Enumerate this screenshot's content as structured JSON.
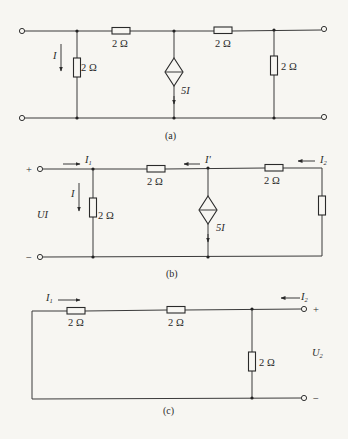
{
  "figure": {
    "colors": {
      "background": "#f7f6f2",
      "ink": "#2a2a2a"
    },
    "panels": [
      {
        "id": "a",
        "caption": "(a)",
        "resistor_labels": [
          "2 Ω",
          "2 Ω",
          "2 Ω",
          "2 Ω"
        ],
        "current_label": "I",
        "source_label": "5I",
        "components": [
          "left shunt resistor 2 Ω with current I downward",
          "series resistor 2 Ω",
          "dependent current source 5I (downward)",
          "series resistor 2 Ω",
          "right shunt resistor 2 Ω"
        ]
      },
      {
        "id": "b",
        "caption": "(b)",
        "resistor_labels": [
          "2 Ω",
          "2 Ω",
          "2 Ω"
        ],
        "current_labels": {
          "i1": "I",
          "i1_sub": "1",
          "i": "I",
          "iprime": "I'",
          "i2": "I",
          "i2_sub": "2"
        },
        "voltage_label": "UI",
        "plus": "+",
        "minus": "−",
        "source_label": "5I"
      },
      {
        "id": "c",
        "caption": "(c)",
        "resistor_labels": [
          "2 Ω",
          "2 Ω",
          "2 Ω"
        ],
        "current_labels": {
          "i1": "I",
          "i1_sub": "1",
          "i2": "I",
          "i2_sub": "2"
        },
        "voltage_label": "U",
        "voltage_sub": "2",
        "plus": "+",
        "minus": "−"
      }
    ]
  }
}
